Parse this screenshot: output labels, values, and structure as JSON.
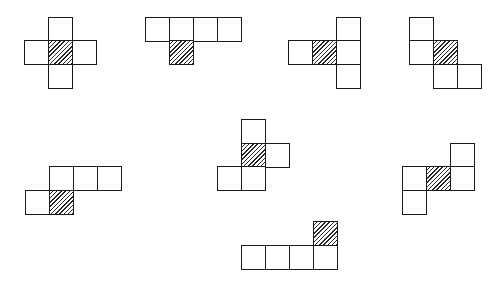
{
  "diagram": {
    "title": "",
    "cell_size": 24,
    "colors": {
      "stroke": "#1a1a1a",
      "fill": "#ffffff",
      "hatch": "#2a2a2a"
    },
    "figures": [
      {
        "name": "figure-1-cross",
        "cells": [
          {
            "x": 48,
            "y": 17,
            "hatched": false
          },
          {
            "x": 24,
            "y": 40,
            "hatched": false
          },
          {
            "x": 48,
            "y": 40,
            "hatched": true
          },
          {
            "x": 72,
            "y": 40,
            "hatched": false
          },
          {
            "x": 48,
            "y": 64,
            "hatched": false
          }
        ]
      },
      {
        "name": "figure-2-row-with-hatched-below",
        "cells": [
          {
            "x": 145,
            "y": 17,
            "hatched": false
          },
          {
            "x": 169,
            "y": 17,
            "hatched": false
          },
          {
            "x": 193,
            "y": 17,
            "hatched": false
          },
          {
            "x": 217,
            "y": 17,
            "hatched": false
          },
          {
            "x": 169,
            "y": 40,
            "hatched": true
          }
        ]
      },
      {
        "name": "figure-3-t-left",
        "cells": [
          {
            "x": 336,
            "y": 17,
            "hatched": false
          },
          {
            "x": 288,
            "y": 40,
            "hatched": false
          },
          {
            "x": 312,
            "y": 40,
            "hatched": true
          },
          {
            "x": 336,
            "y": 40,
            "hatched": false
          },
          {
            "x": 336,
            "y": 64,
            "hatched": false
          }
        ]
      },
      {
        "name": "figure-4-staircase",
        "cells": [
          {
            "x": 409,
            "y": 17,
            "hatched": false
          },
          {
            "x": 409,
            "y": 40,
            "hatched": false
          },
          {
            "x": 433,
            "y": 40,
            "hatched": true
          },
          {
            "x": 433,
            "y": 64,
            "hatched": false
          },
          {
            "x": 457,
            "y": 64,
            "hatched": false
          }
        ]
      },
      {
        "name": "figure-5-s-shape",
        "cells": [
          {
            "x": 49,
            "y": 166,
            "hatched": false
          },
          {
            "x": 73,
            "y": 166,
            "hatched": false
          },
          {
            "x": 97,
            "y": 166,
            "hatched": false
          },
          {
            "x": 25,
            "y": 190,
            "hatched": false
          },
          {
            "x": 49,
            "y": 190,
            "hatched": true
          }
        ]
      },
      {
        "name": "figure-6-f-shape",
        "cells": [
          {
            "x": 241,
            "y": 119,
            "hatched": false
          },
          {
            "x": 241,
            "y": 143,
            "hatched": true
          },
          {
            "x": 265,
            "y": 143,
            "hatched": false
          },
          {
            "x": 217,
            "y": 166,
            "hatched": false
          },
          {
            "x": 241,
            "y": 166,
            "hatched": false
          }
        ]
      },
      {
        "name": "figure-7-w-shape",
        "cells": [
          {
            "x": 450,
            "y": 143,
            "hatched": false
          },
          {
            "x": 402,
            "y": 166,
            "hatched": false
          },
          {
            "x": 426,
            "y": 166,
            "hatched": true
          },
          {
            "x": 450,
            "y": 166,
            "hatched": false
          },
          {
            "x": 402,
            "y": 190,
            "hatched": false
          }
        ]
      },
      {
        "name": "figure-8-l-shape",
        "cells": [
          {
            "x": 313,
            "y": 221,
            "hatched": true
          },
          {
            "x": 241,
            "y": 245,
            "hatched": false
          },
          {
            "x": 265,
            "y": 245,
            "hatched": false
          },
          {
            "x": 289,
            "y": 245,
            "hatched": false
          },
          {
            "x": 313,
            "y": 245,
            "hatched": false
          }
        ]
      }
    ]
  }
}
